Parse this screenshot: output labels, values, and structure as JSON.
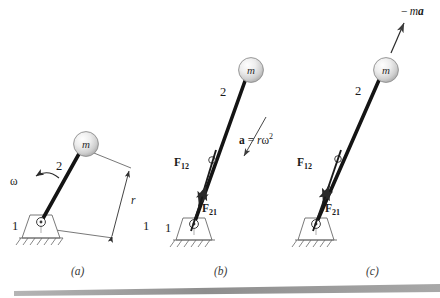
{
  "figure": {
    "panels": [
      {
        "id": "a",
        "caption": "(a)",
        "ground_link_number": "1",
        "moving_link_number": "2",
        "mass_label": "m",
        "omega_label": "ω",
        "radius_label": "r",
        "outer_link_number": "1"
      },
      {
        "id": "b",
        "caption": "(b)",
        "ground_link_number": "1",
        "moving_link_number": "2",
        "mass_label": "m",
        "force_12": "F",
        "force_12_sub": "12",
        "force_21": "F",
        "force_21_sub": "21",
        "accel_bold": "a",
        "accel_eq": " = ",
        "accel_r": "r",
        "accel_omega": "ω",
        "accel_exp": "2"
      },
      {
        "id": "c",
        "caption": "(c)",
        "ground_link_number": "1",
        "moving_link_number": "2",
        "mass_label": "m",
        "force_12": "F",
        "force_12_sub": "12",
        "force_21": "F",
        "force_21_sub": "21",
        "inertia_minus": "− ",
        "inertia_m": "m",
        "inertia_a": "a"
      }
    ],
    "colors": {
      "link": "#141414",
      "thin_line": "#4a4a4a",
      "mass_fill_light": "#fdfdfd",
      "mass_fill_dark": "#b9b9b9",
      "mass_stroke": "#8d8d8d",
      "support_stroke": "#6a6a6a",
      "text": "#1a1a1a",
      "bottom_bar": "#9a9a9a"
    }
  }
}
